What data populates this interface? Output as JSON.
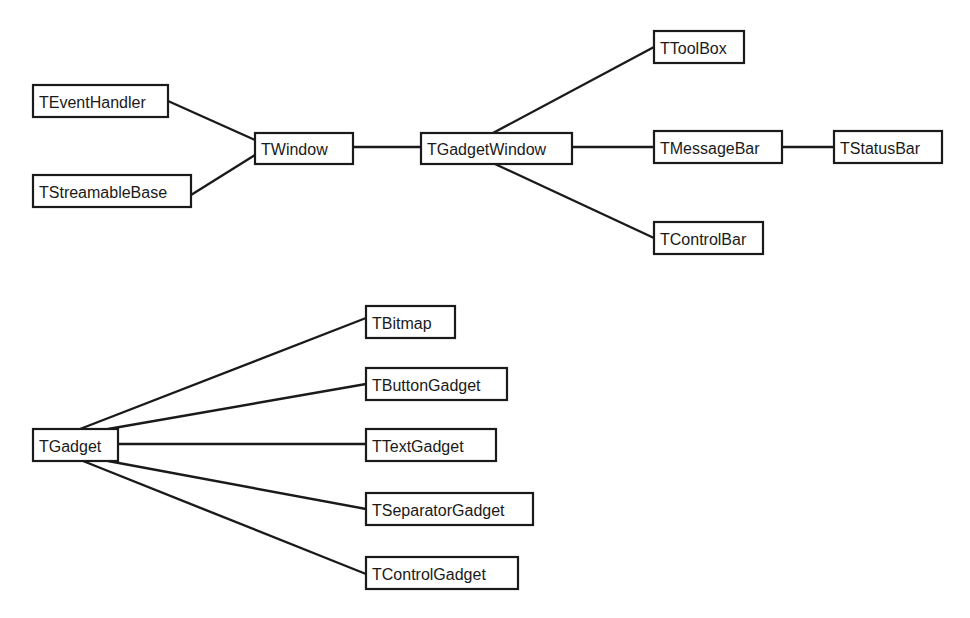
{
  "diagram": {
    "type": "class-hierarchy",
    "groups": [
      {
        "name": "window-hierarchy",
        "nodes": [
          {
            "id": "TEventHandler",
            "label": "TEventHandler"
          },
          {
            "id": "TStreamableBase",
            "label": "TStreamableBase"
          },
          {
            "id": "TWindow",
            "label": "TWindow"
          },
          {
            "id": "TGadgetWindow",
            "label": "TGadgetWindow"
          },
          {
            "id": "TToolBox",
            "label": "TToolBox"
          },
          {
            "id": "TMessageBar",
            "label": "TMessageBar"
          },
          {
            "id": "TStatusBar",
            "label": "TStatusBar"
          },
          {
            "id": "TControlBar",
            "label": "TControlBar"
          }
        ],
        "edges": [
          {
            "from": "TEventHandler",
            "to": "TWindow"
          },
          {
            "from": "TStreamableBase",
            "to": "TWindow"
          },
          {
            "from": "TWindow",
            "to": "TGadgetWindow"
          },
          {
            "from": "TGadgetWindow",
            "to": "TToolBox"
          },
          {
            "from": "TGadgetWindow",
            "to": "TMessageBar"
          },
          {
            "from": "TGadgetWindow",
            "to": "TControlBar"
          },
          {
            "from": "TMessageBar",
            "to": "TStatusBar"
          }
        ]
      },
      {
        "name": "gadget-hierarchy",
        "nodes": [
          {
            "id": "TGadget",
            "label": "TGadget"
          },
          {
            "id": "TBitmap",
            "label": "TBitmap"
          },
          {
            "id": "TButtonGadget",
            "label": "TButtonGadget"
          },
          {
            "id": "TTextGadget",
            "label": "TTextGadget"
          },
          {
            "id": "TSeparatorGadget",
            "label": "TSeparatorGadget"
          },
          {
            "id": "TControlGadget",
            "label": "TControlGadget"
          }
        ],
        "edges": [
          {
            "from": "TGadget",
            "to": "TBitmap"
          },
          {
            "from": "TGadget",
            "to": "TButtonGadget"
          },
          {
            "from": "TGadget",
            "to": "TTextGadget"
          },
          {
            "from": "TGadget",
            "to": "TSeparatorGadget"
          },
          {
            "from": "TGadget",
            "to": "TControlGadget"
          }
        ]
      }
    ],
    "colors": {
      "stroke": "#1a1a1a",
      "background": "#ffffff",
      "text": "#1a1a1a"
    }
  }
}
